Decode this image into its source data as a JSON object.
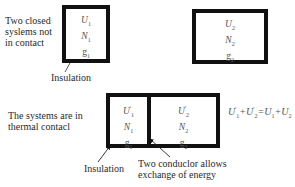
{
  "top_section": {
    "description_lines": [
      "Two closed",
      "syslems not",
      "in contact"
    ],
    "system1": {
      "U": "U",
      "U_sub": "1",
      "N": "N",
      "N_sub": "1",
      "g": "g",
      "g_sub": "1"
    },
    "system2": {
      "U": "U",
      "U_sub": "2",
      "N": "N",
      "N_sub": "2",
      "g": "g",
      "g_sub": "2"
    },
    "insulation_label": "Insulation"
  },
  "bottom_section": {
    "description_lines": [
      "The systems are in",
      "thermal contacl"
    ],
    "system1": {
      "U": "U",
      "U_prime": "'",
      "U_sub": "1",
      "N": "N",
      "N_sub": "1",
      "g": "g",
      "g_sub": "1"
    },
    "system2": {
      "U": "U",
      "U_prime": "'",
      "U_sub": "2",
      "N": "N",
      "N_sub": "2",
      "g": "g",
      "g_sub": "2"
    },
    "insulation_label": "Insulation",
    "conductor_label_lines": [
      "Two conduclor allows",
      "exchange of energy"
    ],
    "equation": {
      "lhs_a": "U",
      "lhs_a_prime": "'",
      "lhs_a_sub": "1",
      "plus1": "+",
      "lhs_b": "U",
      "lhs_b_prime": "'",
      "lhs_b_sub": "2",
      "equals": "=",
      "rhs_a": "U",
      "rhs_a_sub": "1",
      "plus2": "+",
      "rhs_b": "U",
      "rhs_b_sub": "2"
    }
  },
  "colors": {
    "border": "#111111",
    "text": "#2a2a2a",
    "variables": "#555555",
    "background": "#ffffff"
  }
}
